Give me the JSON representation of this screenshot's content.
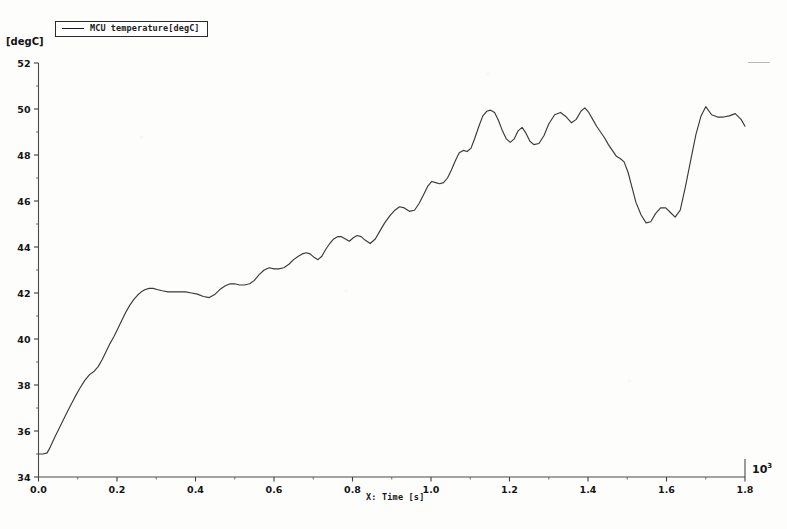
{
  "legend": {
    "entries": [
      {
        "label": "MCU temperature[degC]",
        "color": "#3a3a3a",
        "marker": "line-swatch"
      }
    ]
  },
  "axes": {
    "y_unit_label": "[degC]",
    "x_title": "X: Time [s]",
    "x_multiplier": "10",
    "x_multiplier_exponent": "3"
  },
  "chart_data": {
    "type": "line",
    "title": "",
    "subtitle": "",
    "xlabel": "X: Time [s]",
    "ylabel": "[degC]",
    "xlim": [
      0.0,
      1.8
    ],
    "ylim": [
      34,
      52
    ],
    "x_scale_multiplier": 1000,
    "x_tick_labels": [
      "0.0",
      "0.2",
      "0.4",
      "0.6",
      "0.8",
      "1.0",
      "1.2",
      "1.4",
      "1.6",
      "1.8"
    ],
    "x_ticks": [
      0.0,
      0.2,
      0.4,
      0.6,
      0.8,
      1.0,
      1.2,
      1.4,
      1.6,
      1.8
    ],
    "x_minor_ticks": [
      0.1,
      0.3,
      0.5,
      0.7,
      0.9,
      1.1,
      1.3,
      1.5,
      1.7
    ],
    "y_tick_labels": [
      "34",
      "36",
      "38",
      "40",
      "42",
      "44",
      "46",
      "48",
      "50",
      "52"
    ],
    "y_ticks": [
      34,
      36,
      38,
      40,
      42,
      44,
      46,
      48,
      50,
      52
    ],
    "y_minor_ticks": [
      35,
      37,
      39,
      41,
      43,
      45,
      47,
      49,
      51
    ],
    "grid": false,
    "legend_position": "top-left",
    "series": [
      {
        "name": "MCU temperature[degC]",
        "color": "#3a3a3a",
        "x": [
          0.0,
          0.012,
          0.022,
          0.03,
          0.042,
          0.055,
          0.068,
          0.08,
          0.092,
          0.105,
          0.118,
          0.13,
          0.142,
          0.152,
          0.162,
          0.172,
          0.182,
          0.192,
          0.202,
          0.212,
          0.222,
          0.232,
          0.242,
          0.252,
          0.262,
          0.272,
          0.282,
          0.292,
          0.302,
          0.315,
          0.33,
          0.345,
          0.36,
          0.375,
          0.39,
          0.405,
          0.42,
          0.435,
          0.45,
          0.462,
          0.475,
          0.488,
          0.5,
          0.512,
          0.525,
          0.538,
          0.55,
          0.562,
          0.575,
          0.588,
          0.6,
          0.612,
          0.625,
          0.638,
          0.65,
          0.662,
          0.672,
          0.682,
          0.692,
          0.702,
          0.712,
          0.722,
          0.732,
          0.742,
          0.752,
          0.762,
          0.772,
          0.782,
          0.792,
          0.802,
          0.812,
          0.822,
          0.832,
          0.845,
          0.858,
          0.87,
          0.882,
          0.895,
          0.908,
          0.92,
          0.932,
          0.945,
          0.958,
          0.97,
          0.982,
          0.992,
          1.002,
          1.012,
          1.022,
          1.032,
          1.042,
          1.052,
          1.062,
          1.072,
          1.082,
          1.092,
          1.102,
          1.112,
          1.122,
          1.132,
          1.142,
          1.152,
          1.162,
          1.172,
          1.182,
          1.192,
          1.202,
          1.212,
          1.222,
          1.232,
          1.242,
          1.252,
          1.262,
          1.275,
          1.288,
          1.3,
          1.315,
          1.33,
          1.345,
          1.358,
          1.37,
          1.382,
          1.392,
          1.402,
          1.412,
          1.422,
          1.432,
          1.442,
          1.452,
          1.462,
          1.472,
          1.482,
          1.492,
          1.502,
          1.512,
          1.522,
          1.535,
          1.548,
          1.56,
          1.572,
          1.585,
          1.598,
          1.61,
          1.622,
          1.635,
          1.648,
          1.662,
          1.675,
          1.688,
          1.7,
          1.715,
          1.73,
          1.745,
          1.76,
          1.775,
          1.79,
          1.8
        ],
        "y": [
          35.0,
          35.0,
          35.05,
          35.3,
          35.75,
          36.2,
          36.65,
          37.05,
          37.45,
          37.85,
          38.2,
          38.45,
          38.6,
          38.8,
          39.1,
          39.45,
          39.8,
          40.1,
          40.45,
          40.8,
          41.15,
          41.45,
          41.7,
          41.9,
          42.05,
          42.15,
          42.2,
          42.2,
          42.15,
          42.1,
          42.05,
          42.05,
          42.05,
          42.05,
          42.0,
          41.95,
          41.85,
          41.8,
          41.95,
          42.15,
          42.3,
          42.4,
          42.4,
          42.35,
          42.35,
          42.4,
          42.55,
          42.8,
          43.0,
          43.1,
          43.05,
          43.05,
          43.1,
          43.25,
          43.45,
          43.6,
          43.7,
          43.75,
          43.7,
          43.55,
          43.45,
          43.6,
          43.9,
          44.15,
          44.35,
          44.45,
          44.45,
          44.35,
          44.25,
          44.4,
          44.5,
          44.45,
          44.3,
          44.15,
          44.35,
          44.7,
          45.05,
          45.35,
          45.6,
          45.75,
          45.7,
          45.55,
          45.6,
          45.9,
          46.3,
          46.65,
          46.85,
          46.8,
          46.75,
          46.8,
          47.0,
          47.35,
          47.75,
          48.1,
          48.2,
          48.15,
          48.3,
          48.75,
          49.25,
          49.7,
          49.9,
          49.95,
          49.85,
          49.5,
          49.05,
          48.7,
          48.55,
          48.7,
          49.05,
          49.2,
          48.95,
          48.6,
          48.45,
          48.5,
          48.85,
          49.35,
          49.75,
          49.85,
          49.65,
          49.4,
          49.55,
          49.9,
          50.05,
          49.85,
          49.55,
          49.25,
          49.0,
          48.75,
          48.45,
          48.2,
          47.95,
          47.85,
          47.7,
          47.25,
          46.6,
          45.95,
          45.4,
          45.05,
          45.1,
          45.45,
          45.7,
          45.7,
          45.5,
          45.3,
          45.6,
          46.6,
          47.8,
          48.9,
          49.7,
          50.1,
          49.75,
          49.65,
          49.65,
          49.7,
          49.8,
          49.55,
          49.25
        ]
      }
    ],
    "annotations": [
      {
        "text": "peak temperature reaches approximately 50.1 degC near t = 1.26e3 s"
      },
      {
        "text": "minimum temperature 35.0 degC at t = 0 s"
      },
      {
        "text": "local minimum approximately 45.0 degC near t = 1.42e3 s"
      }
    ]
  }
}
